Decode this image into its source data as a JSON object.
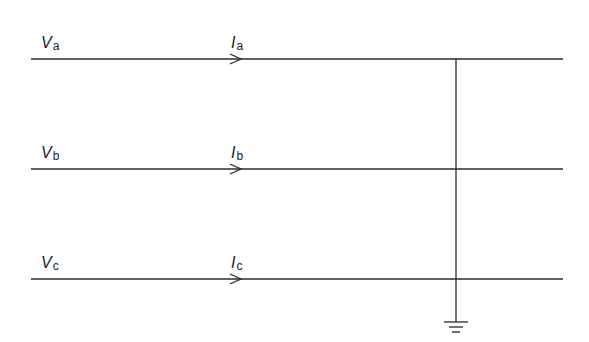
{
  "diagram": {
    "type": "three-phase line to ground fault",
    "phases": [
      {
        "voltage_label": "V",
        "voltage_sub": "a",
        "current_label": "I",
        "current_sub": "a",
        "y": 59
      },
      {
        "voltage_label": "V",
        "voltage_sub": "b",
        "current_label": "I",
        "current_sub": "b",
        "y": 169
      },
      {
        "voltage_label": "V",
        "voltage_sub": "c",
        "current_label": "I",
        "current_sub": "c",
        "y": 279
      }
    ],
    "bus_x": 456,
    "ground_symbol": "ground-icon",
    "line_color": "#2b2b2b"
  }
}
